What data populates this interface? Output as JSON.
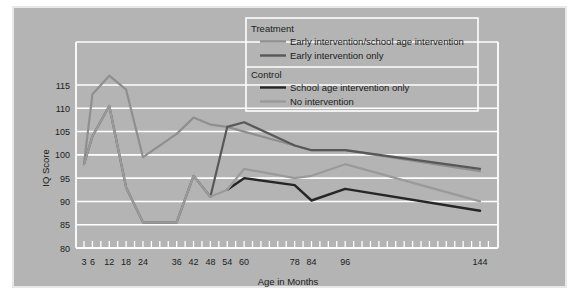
{
  "chart_data": {
    "type": "line",
    "title": "",
    "xlabel": "Age in Months",
    "ylabel": "IQ Score",
    "ylim": [
      80,
      120
    ],
    "ytick_labels": [
      "80",
      "85",
      "90",
      "95",
      "100",
      "105",
      "110",
      "115"
    ],
    "yticks": [
      80,
      85,
      90,
      95,
      100,
      105,
      110,
      115
    ],
    "xlim": [
      0,
      150
    ],
    "xtick_labels": [
      "3",
      "6",
      "12",
      "18",
      "24",
      "36",
      "42",
      "48",
      "54",
      "60",
      "78",
      "84",
      "96",
      "144"
    ],
    "xticks": [
      3,
      6,
      12,
      18,
      24,
      36,
      42,
      48,
      54,
      60,
      78,
      84,
      96,
      144
    ],
    "grid": "horizontal",
    "legend_position": "top-right",
    "series": [
      {
        "name": "Early intervention/school age intervention",
        "group": "Treatment",
        "color": "#8f8f8f",
        "width": 2.2,
        "x": [
          3,
          6,
          12,
          18,
          24,
          36,
          42,
          48,
          54,
          60,
          78,
          84,
          96,
          144
        ],
        "values": [
          98,
          113,
          117,
          114,
          99.5,
          104.5,
          108,
          106.5,
          106,
          105,
          102,
          101,
          101,
          96.5
        ]
      },
      {
        "name": "Early intervention only",
        "group": "Treatment",
        "color": "#585858",
        "width": 2.2,
        "x": [
          3,
          6,
          12,
          18,
          24,
          36,
          42,
          48,
          54,
          60,
          78,
          84,
          96,
          144
        ],
        "values": [
          98,
          104,
          110.5,
          93,
          85.5,
          85.5,
          95.5,
          91,
          106,
          107,
          102,
          101,
          101,
          97
        ]
      },
      {
        "name": "School age intervention only",
        "group": "Control",
        "color": "#262626",
        "width": 2.4,
        "x": [
          54,
          60,
          78,
          84,
          96,
          144
        ],
        "values": [
          92.5,
          95,
          93.5,
          90.2,
          92.7,
          88
        ]
      },
      {
        "name": "No intervention",
        "group": "Control",
        "color": "#9a9a9a",
        "width": 2.2,
        "x": [
          3,
          6,
          12,
          18,
          24,
          36,
          42,
          48,
          54,
          60,
          78,
          84,
          96,
          144
        ],
        "values": [
          98,
          104,
          110.5,
          93,
          85.5,
          85.5,
          95.5,
          91,
          92.5,
          97,
          95,
          95.5,
          98,
          90
        ]
      }
    ]
  },
  "legend": {
    "groups": [
      {
        "heading": "Treatment",
        "entries": [
          {
            "label": "Early intervention/school age intervention",
            "color": "#8f8f8f"
          },
          {
            "label": "Early intervention only",
            "color": "#585858"
          }
        ]
      },
      {
        "heading": "Control",
        "entries": [
          {
            "label": "School age intervention only",
            "color": "#262626"
          },
          {
            "label": "No intervention",
            "color": "#9a9a9a"
          }
        ]
      }
    ]
  },
  "colors": {
    "panel_background": "#b4b4b4",
    "gridline": "#ffffff",
    "axis": "#ffffff",
    "text": "#1c1c1c",
    "page_background": "#ffffff"
  }
}
